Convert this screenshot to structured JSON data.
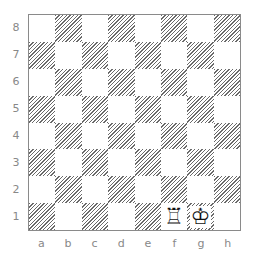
{
  "board": {
    "ranks": [
      "8",
      "7",
      "6",
      "5",
      "4",
      "3",
      "2",
      "1"
    ],
    "files": [
      "a",
      "b",
      "c",
      "d",
      "e",
      "f",
      "g",
      "h"
    ],
    "pieces": [
      {
        "square": "f1",
        "piece": "white-rook",
        "glyph": "♖"
      },
      {
        "square": "g1",
        "piece": "white-king",
        "glyph": "♔"
      }
    ],
    "colors": {
      "border": "#8a8a8a",
      "hatch": "#6a6a6a",
      "label": "#888888"
    }
  }
}
